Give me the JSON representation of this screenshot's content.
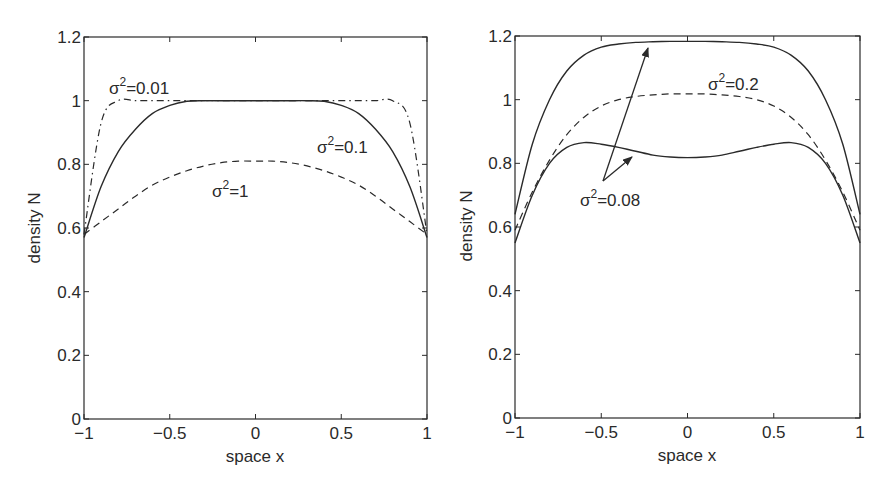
{
  "chart_data": [
    {
      "type": "line",
      "panel": "left",
      "title": "",
      "xlabel": "space x",
      "ylabel": "density N",
      "xlim": [
        -1,
        1
      ],
      "ylim": [
        0,
        1.2
      ],
      "xticks": [
        "-1",
        "-0.5",
        "0",
        "0.5",
        "1"
      ],
      "yticks": [
        "0",
        "0.2",
        "0.4",
        "0.6",
        "0.8",
        "1",
        "1.2"
      ],
      "grid": false,
      "legend": null,
      "x": [
        -1,
        -0.9,
        -0.8,
        -0.7,
        -0.6,
        -0.5,
        -0.4,
        -0.3,
        -0.2,
        -0.1,
        0,
        0.1,
        0.2,
        0.3,
        0.4,
        0.5,
        0.6,
        0.7,
        0.8,
        0.9,
        1
      ],
      "series": [
        {
          "name": "σ²=0.01",
          "style": "dash-dot",
          "values": [
            0.58,
            0.93,
            1.0,
            1.0,
            1.0,
            1.0,
            1.0,
            1.0,
            1.0,
            1.0,
            1.0,
            1.0,
            1.0,
            1.0,
            1.0,
            1.0,
            1.0,
            1.0,
            1.0,
            0.93,
            0.58
          ]
        },
        {
          "name": "σ²=0.1",
          "style": "solid",
          "values": [
            0.57,
            0.73,
            0.84,
            0.91,
            0.96,
            0.985,
            0.998,
            1.0,
            1.0,
            1.0,
            1.0,
            1.0,
            1.0,
            1.0,
            0.998,
            0.985,
            0.96,
            0.91,
            0.84,
            0.73,
            0.57
          ]
        },
        {
          "name": "σ²=1",
          "style": "dashed",
          "values": [
            0.58,
            0.62,
            0.66,
            0.7,
            0.735,
            0.76,
            0.78,
            0.795,
            0.805,
            0.81,
            0.81,
            0.81,
            0.805,
            0.795,
            0.78,
            0.76,
            0.735,
            0.7,
            0.66,
            0.62,
            0.58
          ]
        }
      ],
      "annotations": [
        {
          "text": "σ²=0.01",
          "x": -0.9,
          "y": 1.05
        },
        {
          "text": "σ²=0.1",
          "x": 0.45,
          "y": 0.84
        },
        {
          "text": "σ²=1",
          "x": -0.3,
          "y": 0.71
        }
      ]
    },
    {
      "type": "line",
      "panel": "right",
      "title": "",
      "xlabel": "space x",
      "ylabel": "density N",
      "xlim": [
        -1,
        1
      ],
      "ylim": [
        0,
        1.2
      ],
      "xticks": [
        "-1",
        "-0.5",
        "0",
        "0.5",
        "1"
      ],
      "yticks": [
        "0",
        "0.2",
        "0.4",
        "0.6",
        "0.8",
        "1",
        "1.2"
      ],
      "grid": false,
      "legend": null,
      "x": [
        -1,
        -0.9,
        -0.8,
        -0.7,
        -0.6,
        -0.5,
        -0.4,
        -0.3,
        -0.2,
        -0.1,
        0,
        0.1,
        0.2,
        0.3,
        0.4,
        0.5,
        0.6,
        0.7,
        0.8,
        0.9,
        1
      ],
      "series": [
        {
          "name": "σ²=0.08 (upper)",
          "style": "solid",
          "values": [
            0.64,
            0.86,
            1.0,
            1.09,
            1.14,
            1.165,
            1.175,
            1.18,
            1.182,
            1.183,
            1.183,
            1.183,
            1.182,
            1.18,
            1.175,
            1.165,
            1.14,
            1.09,
            1.0,
            0.86,
            0.64
          ]
        },
        {
          "name": "σ²=0.2",
          "style": "dashed",
          "values": [
            0.59,
            0.71,
            0.81,
            0.89,
            0.945,
            0.98,
            1.0,
            1.01,
            1.015,
            1.018,
            1.018,
            1.018,
            1.015,
            1.01,
            1.0,
            0.98,
            0.945,
            0.89,
            0.81,
            0.71,
            0.59
          ]
        },
        {
          "name": "σ²=0.08 (lower)",
          "style": "solid",
          "values": [
            0.55,
            0.7,
            0.8,
            0.85,
            0.865,
            0.86,
            0.85,
            0.838,
            0.826,
            0.82,
            0.818,
            0.82,
            0.826,
            0.838,
            0.85,
            0.86,
            0.865,
            0.85,
            0.8,
            0.7,
            0.55
          ]
        }
      ],
      "annotations": [
        {
          "text": "σ²=0.2",
          "x": 0.22,
          "y": 1.05
        },
        {
          "text": "σ²=0.08",
          "x": -0.6,
          "y": 0.72,
          "arrows_to": [
            [
              -0.23,
              1.16
            ],
            [
              -0.34,
              0.84
            ]
          ]
        }
      ]
    }
  ],
  "labels": {
    "left": {
      "xlabel": "space x",
      "ylabel": "density N",
      "anno_001_base": "σ",
      "anno_001_sup": "2",
      "anno_001_rest": "=0.01",
      "anno_01_base": "σ",
      "anno_01_sup": "2",
      "anno_01_rest": "=0.1",
      "anno_1_base": "σ",
      "anno_1_sup": "2",
      "anno_1_rest": "=1"
    },
    "right": {
      "xlabel": "space x",
      "ylabel": "density N",
      "anno_02_base": "σ",
      "anno_02_sup": "2",
      "anno_02_rest": "=0.2",
      "anno_008_base": "σ",
      "anno_008_sup": "2",
      "anno_008_rest": "=0.08"
    },
    "xticks": [
      "−1",
      "−0.5",
      "0",
      "0.5",
      "1"
    ],
    "yticks": [
      "0",
      "0.2",
      "0.4",
      "0.6",
      "0.8",
      "1",
      "1.2"
    ]
  },
  "colors": {
    "axis": "#2a2a2a",
    "line": "#2a2a2a",
    "background": "#ffffff"
  }
}
